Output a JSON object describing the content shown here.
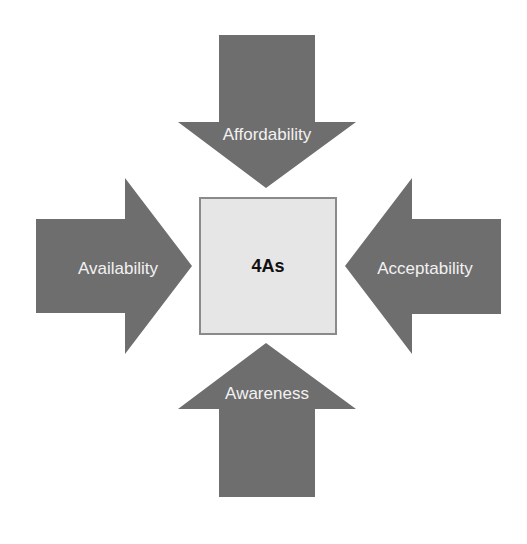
{
  "diagram": {
    "center": {
      "label": "4As",
      "fill": "#e6e6e6",
      "border": "#8a8a8a"
    },
    "arrows": [
      {
        "id": "top",
        "label": "Affordability",
        "direction": "down"
      },
      {
        "id": "left",
        "label": "Availability",
        "direction": "right"
      },
      {
        "id": "right",
        "label": "Acceptability",
        "direction": "left"
      },
      {
        "id": "bottom",
        "label": "Awareness",
        "direction": "up"
      }
    ],
    "colors": {
      "arrow_fill": "#6e6e6e",
      "arrow_text": "#f2f2f2",
      "center_text": "#111111",
      "background": "#ffffff"
    }
  }
}
